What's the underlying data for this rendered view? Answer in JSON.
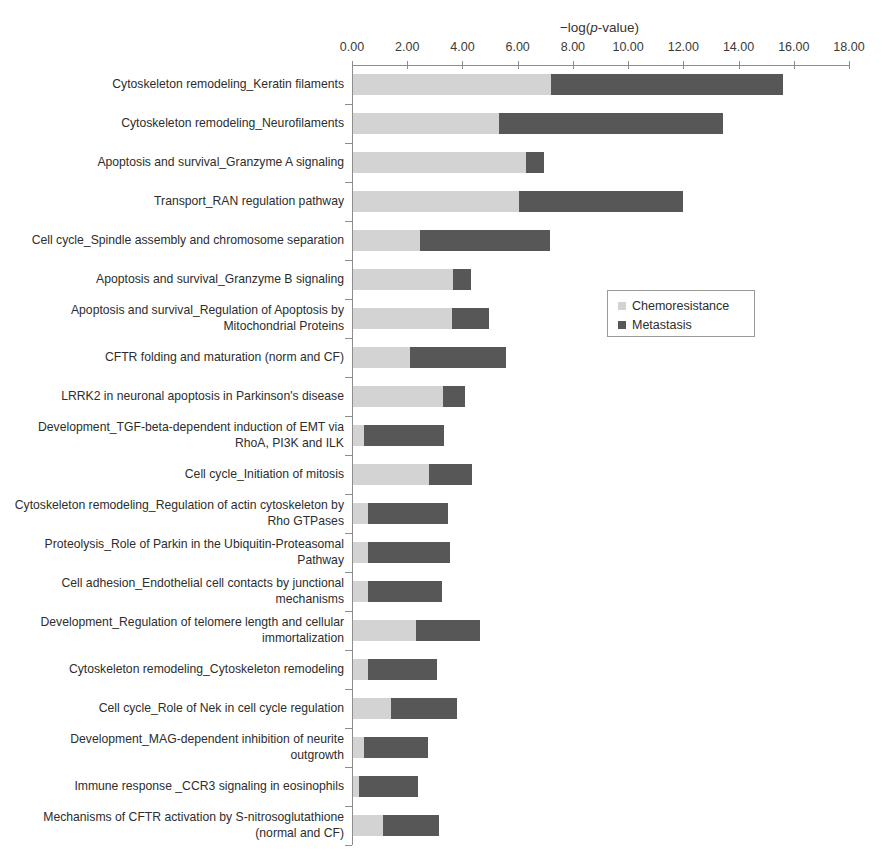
{
  "chart_data": {
    "type": "bar",
    "orientation": "horizontal",
    "stacked": true,
    "title": "",
    "xlabel": "−log(p-value)",
    "ylabel": "",
    "xlim": [
      0,
      18
    ],
    "xticks": [
      "0.00",
      "2.00",
      "4.00",
      "6.00",
      "8.00",
      "10.00",
      "12.00",
      "14.00",
      "16.00",
      "18.00"
    ],
    "grid": false,
    "legend_position": "middle-right",
    "legend": [
      "Chemoresistance",
      "Metastasis"
    ],
    "colors": {
      "chemoresistance": "#d3d3d3",
      "metastasis": "#575757",
      "axis": "#8d8d8d",
      "text": "#2d2d2d",
      "background": "#ffffff"
    },
    "categories": [
      "Cytoskeleton remodeling_Keratin filaments",
      "Cytoskeleton remodeling_Neurofilaments",
      "Apoptosis and survival_Granzyme A signaling",
      "Transport_RAN regulation pathway",
      "Cell cycle_Spindle assembly and chromosome separation",
      "Apoptosis and survival_Granzyme B signaling",
      "Apoptosis and survival_Regulation of Apoptosis by Mitochondrial Proteins",
      "CFTR folding and maturation (norm and CF)",
      "LRRK2 in neuronal apoptosis in Parkinson's disease",
      "Development_TGF-beta-dependent induction of EMT via RhoA, PI3K and ILK",
      "Cell cycle_Initiation of mitosis",
      "Cytoskeleton remodeling_Regulation of actin cytoskeleton by Rho GTPases",
      "Proteolysis_Role of Parkin in the Ubiquitin-Proteasomal Pathway",
      "Cell adhesion_Endothelial cell contacts by junctional mechanisms",
      "Development_Regulation of telomere length and cellular immortalization",
      "Cytoskeleton remodeling_Cytoskeleton remodeling",
      "Cell cycle_Role of Nek in cell cycle regulation",
      "Development_MAG-dependent inhibition of neurite outgrowth",
      "Immune response _CCR3 signaling in eosinophils",
      "Mechanisms of CFTR activation by S-nitrosoglutathione (normal and CF)"
    ],
    "series": [
      {
        "name": "Chemoresistance",
        "color": "#d3d3d3",
        "values": [
          7.17,
          5.28,
          6.27,
          6.03,
          2.42,
          3.63,
          3.59,
          2.07,
          3.27,
          0.41,
          2.75,
          0.56,
          0.56,
          0.53,
          2.28,
          0.53,
          1.37,
          0.41,
          0.2,
          1.08
        ]
      },
      {
        "name": "Metastasis",
        "color": "#575757",
        "values": [
          8.41,
          8.12,
          0.66,
          5.94,
          4.71,
          0.63,
          1.32,
          3.48,
          0.77,
          2.89,
          1.57,
          2.89,
          2.97,
          2.71,
          2.31,
          2.5,
          2.38,
          2.32,
          2.17,
          2.03
        ]
      }
    ],
    "totals": [
      15.58,
      13.4,
      6.93,
      11.97,
      7.13,
      4.26,
      4.91,
      5.55,
      4.04,
      3.3,
      4.32,
      3.45,
      3.53,
      3.24,
      4.59,
      3.03,
      3.75,
      2.73,
      2.37,
      3.11
    ]
  },
  "axis": {
    "title_prefix": "−log(",
    "title_italic": "p",
    "title_suffix": "-value)"
  },
  "legend": {
    "items": [
      {
        "label": "Chemoresistance",
        "swatch": "legend-swatch-chemoresistance"
      },
      {
        "label": "Metastasis",
        "swatch": "legend-swatch-metastasis"
      }
    ]
  }
}
